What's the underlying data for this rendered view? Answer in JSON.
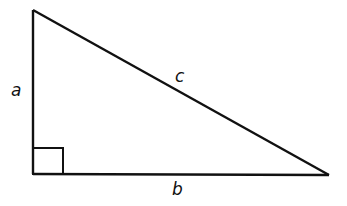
{
  "diagram": {
    "type": "right-triangle",
    "labels": {
      "a": "a",
      "b": "b",
      "c": "c"
    },
    "colors": {
      "stroke": "#111111",
      "background": "#ffffff"
    }
  }
}
